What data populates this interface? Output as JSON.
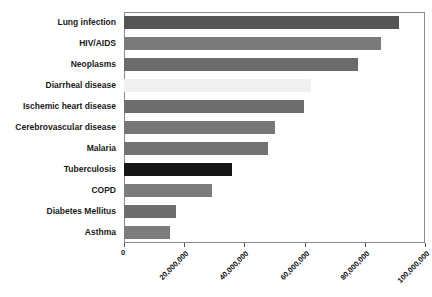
{
  "chart_data": {
    "type": "bar",
    "orientation": "horizontal",
    "title": "",
    "xlabel": "",
    "ylabel": "",
    "xlim": [
      0,
      100000000
    ],
    "grid": false,
    "legend": null,
    "categories": [
      "Lung infection",
      "HIV/AIDS",
      "Neoplasms",
      "Diarrheal disease",
      "Ischemic heart disease",
      "Cerebrovascular disease",
      "Malaria",
      "Tuberculosis",
      "COPD",
      "Diabetes Mellitus",
      "Asthma"
    ],
    "values": [
      91300000,
      85300000,
      77600000,
      62000000,
      59700000,
      50300000,
      47700000,
      36000000,
      29300000,
      17300000,
      15300000
    ],
    "bar_colors": [
      "#555555",
      "#7a7a7a",
      "#6b6b6b",
      "#f0f0f0",
      "#6e6e6e",
      "#767676",
      "#737373",
      "#161616",
      "#7c7c7c",
      "#6e6e6e",
      "#7c7c7c"
    ],
    "xticks": [
      0,
      20000000,
      40000000,
      60000000,
      80000000,
      100000000
    ],
    "xticklabels": [
      "0",
      "20,000,000",
      "40,000,000",
      "60,000,000",
      "80,000,000",
      "100,000,000"
    ],
    "axis_color": "#8a8a8a",
    "background": "#ffffff"
  }
}
